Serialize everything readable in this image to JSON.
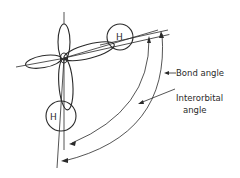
{
  "diagram": {
    "atoms": {
      "hydrogen_right": "H",
      "hydrogen_left": "H"
    },
    "labels": {
      "bond_angle": "Bond angle",
      "interorbital_line1": "Interorbital",
      "interorbital_line2": "angle"
    },
    "colors": {
      "line": "#2a2a2a",
      "background": "#ffffff"
    }
  }
}
